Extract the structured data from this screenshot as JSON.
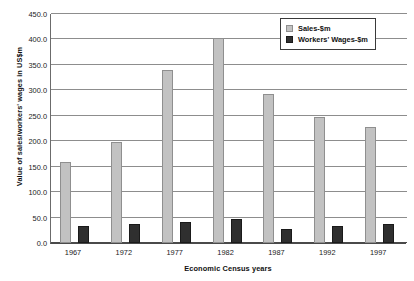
{
  "chart_data": {
    "type": "bar",
    "title": "",
    "xlabel": "Economic Census years",
    "ylabel": "Value of sales/workers' wages in US$m",
    "categories": [
      "1967",
      "1972",
      "1977",
      "1982",
      "1987",
      "1992",
      "1997"
    ],
    "series": [
      {
        "name": "Sales-$m",
        "color": "#c2c2c2",
        "values": [
          160,
          199,
          340,
          402,
          293,
          248,
          228
        ]
      },
      {
        "name": "Workers' Wages-$m",
        "color": "#2f2f2f",
        "values": [
          33,
          38,
          42,
          47,
          27,
          34,
          38
        ]
      }
    ],
    "ylim": [
      0,
      450
    ],
    "yticks": [
      "0.0",
      "50.0",
      "100.0",
      "150.0",
      "200.0",
      "250.0",
      "300.0",
      "350.0",
      "400.0",
      "450.0"
    ],
    "ytick_values": [
      0,
      50,
      100,
      150,
      200,
      250,
      300,
      350,
      400,
      450
    ],
    "grid": true,
    "legend_position": "top-right"
  }
}
